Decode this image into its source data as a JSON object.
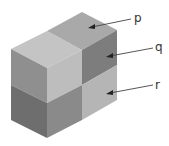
{
  "diagram": {
    "labels": [
      {
        "id": "p",
        "text": "p",
        "points_to": "top face of back cube"
      },
      {
        "id": "q",
        "text": "q",
        "points_to": "right face of upper back cube"
      },
      {
        "id": "r",
        "text": "r",
        "points_to": "right face of lower back cube"
      }
    ],
    "colors": {
      "top_front": "#c4c4c4",
      "top_back": "#a9a9a9",
      "left_upper": "#8f8f8f",
      "left_lower": "#6e6e6e",
      "front_upper": "#bdbdbd",
      "front_lower": "#8a8a8a",
      "side_upper": "#7d7d7d",
      "side_lower": "#b5b5b5",
      "arrow": "#444444"
    }
  }
}
